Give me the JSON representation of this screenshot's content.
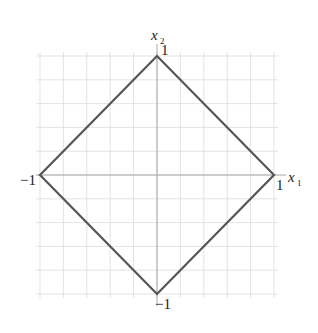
{
  "diagram": {
    "x_axis": {
      "label": "x",
      "subscript": "1",
      "tick_pos": "1",
      "tick_neg": "−1"
    },
    "y_axis": {
      "label": "x",
      "subscript": "2",
      "tick_pos": "1",
      "tick_neg": "−1"
    },
    "grid": {
      "divisions_per_unit": 5,
      "range": [
        -1,
        1
      ]
    },
    "shape": {
      "type": "diamond",
      "vertices": [
        [
          1,
          0
        ],
        [
          0,
          1
        ],
        [
          -1,
          0
        ],
        [
          0,
          -1
        ]
      ]
    },
    "colors": {
      "shape": "#555555",
      "grid": "#dcdcdc",
      "axes": "#a8a8a8",
      "text": "#222222"
    }
  }
}
